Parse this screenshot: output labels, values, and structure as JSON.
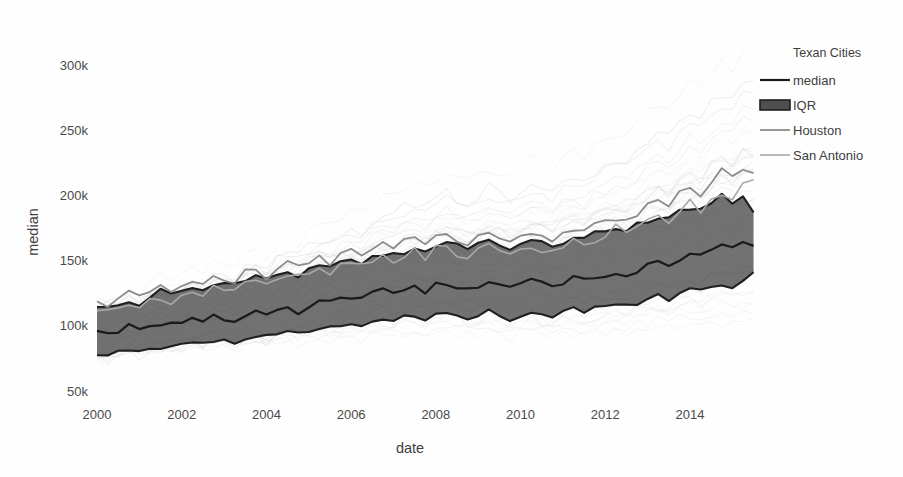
{
  "chart_data": {
    "type": "line",
    "title": "",
    "xlabel": "date",
    "ylabel": "median",
    "xlim": [
      2000.0,
      2015.6
    ],
    "ylim": [
      50000,
      310000
    ],
    "grid": false,
    "y_tick_labels": [
      "50k",
      "100k",
      "150k",
      "200k",
      "250k",
      "300k"
    ],
    "y_tick_values": [
      50000,
      100000,
      150000,
      200000,
      250000,
      300000
    ],
    "x_tick_labels": [
      "2000",
      "2002",
      "2004",
      "2006",
      "2008",
      "2010",
      "2012",
      "2014"
    ],
    "x_tick_values": [
      2000,
      2002,
      2004,
      2006,
      2008,
      2010,
      2012,
      2014
    ],
    "legend": {
      "title": "Texan Cities",
      "position": "right",
      "entries": [
        {
          "label": "median",
          "marker": "line",
          "color": "#1a1a1a",
          "width": 2.2
        },
        {
          "label": "IQR",
          "marker": "band",
          "color": "#555555",
          "width": 9
        },
        {
          "label": "Houston",
          "marker": "line",
          "color": "#8c8c8c",
          "width": 1.8
        },
        {
          "label": "San Antonio",
          "marker": "line",
          "color": "#a8a8a8",
          "width": 1.6
        }
      ]
    },
    "x": [
      2000.0,
      2000.25,
      2000.5,
      2000.75,
      2001.0,
      2001.25,
      2001.5,
      2001.75,
      2002.0,
      2002.25,
      2002.5,
      2002.75,
      2003.0,
      2003.25,
      2003.5,
      2003.75,
      2004.0,
      2004.25,
      2004.5,
      2004.75,
      2005.0,
      2005.25,
      2005.5,
      2005.75,
      2006.0,
      2006.25,
      2006.5,
      2006.75,
      2007.0,
      2007.25,
      2007.5,
      2007.75,
      2008.0,
      2008.25,
      2008.5,
      2008.75,
      2009.0,
      2009.25,
      2009.5,
      2009.75,
      2010.0,
      2010.25,
      2010.5,
      2010.75,
      2011.0,
      2011.25,
      2011.5,
      2011.75,
      2012.0,
      2012.25,
      2012.5,
      2012.75,
      2013.0,
      2013.25,
      2013.5,
      2013.75,
      2014.0,
      2014.25,
      2014.5,
      2014.75,
      2015.0,
      2015.25,
      2015.5
    ],
    "series": [
      {
        "name": "median",
        "color": "#1a1a1a",
        "width": 2.2,
        "values": [
          95000,
          92000,
          97000,
          99000,
          96000,
          100000,
          102000,
          100000,
          103000,
          105000,
          103000,
          106000,
          107000,
          105000,
          109000,
          110000,
          108000,
          112000,
          114000,
          112000,
          116000,
          118000,
          117000,
          120000,
          121000,
          120000,
          124000,
          126000,
          125000,
          128000,
          129000,
          127000,
          130000,
          132000,
          130000,
          128000,
          130000,
          133000,
          131000,
          129000,
          132000,
          134000,
          132000,
          131000,
          134000,
          136000,
          134000,
          137000,
          139000,
          141000,
          140000,
          143000,
          146000,
          148000,
          147000,
          151000,
          154000,
          152000,
          157000,
          160000,
          158000,
          163000,
          163000
        ]
      },
      {
        "name": "IQR_upper",
        "color": "#555555",
        "width": 1,
        "values": [
          115000,
          113000,
          118000,
          120000,
          118000,
          122000,
          125000,
          123000,
          127000,
          129000,
          127000,
          131000,
          133000,
          131000,
          135000,
          137000,
          135000,
          139000,
          142000,
          140000,
          144000,
          147000,
          145000,
          149000,
          151000,
          149000,
          153000,
          156000,
          154000,
          158000,
          160000,
          157000,
          161000,
          163000,
          160000,
          158000,
          161000,
          164000,
          162000,
          159000,
          163000,
          166000,
          163000,
          161000,
          165000,
          168000,
          165000,
          169000,
          172000,
          175000,
          173000,
          177000,
          181000,
          184000,
          182000,
          187000,
          191000,
          188000,
          194000,
          198000,
          195000,
          201000,
          185000
        ]
      },
      {
        "name": "IQR_lower",
        "color": "#555555",
        "width": 1,
        "values": [
          78000,
          76000,
          80000,
          82000,
          80000,
          83000,
          85000,
          83000,
          86000,
          88000,
          86000,
          89000,
          90000,
          88000,
          91000,
          93000,
          91000,
          94000,
          96000,
          94000,
          97000,
          99000,
          97000,
          100000,
          102000,
          100000,
          103000,
          105000,
          103000,
          106000,
          108000,
          106000,
          108000,
          110000,
          108000,
          106000,
          108000,
          110000,
          108000,
          106000,
          109000,
          111000,
          109000,
          107000,
          110000,
          112000,
          110000,
          113000,
          115000,
          117000,
          115000,
          118000,
          121000,
          123000,
          121000,
          125000,
          128000,
          126000,
          130000,
          133000,
          131000,
          136000,
          140000
        ]
      },
      {
        "name": "Houston",
        "color": "#8c8c8c",
        "width": 1.8,
        "values": [
          118000,
          116000,
          121000,
          124000,
          121000,
          126000,
          129000,
          127000,
          131000,
          134000,
          131000,
          136000,
          138000,
          135000,
          140000,
          142000,
          139000,
          144000,
          147000,
          144000,
          149000,
          152000,
          149000,
          154000,
          156000,
          153000,
          158000,
          162000,
          159000,
          164000,
          166000,
          162000,
          167000,
          170000,
          166000,
          163000,
          166000,
          170000,
          167000,
          164000,
          169000,
          173000,
          169000,
          166000,
          171000,
          175000,
          171000,
          176000,
          180000,
          185000,
          181000,
          187000,
          193000,
          198000,
          194000,
          202000,
          208000,
          203000,
          211000,
          218000,
          213000,
          222000,
          219000
        ]
      },
      {
        "name": "San Antonio",
        "color": "#a8a8a8",
        "width": 1.6,
        "values": [
          112000,
          110000,
          114000,
          117000,
          115000,
          119000,
          122000,
          120000,
          124000,
          126000,
          124000,
          128000,
          130000,
          128000,
          132000,
          134000,
          132000,
          136000,
          139000,
          136000,
          141000,
          144000,
          141000,
          146000,
          148000,
          145000,
          150000,
          153000,
          150000,
          155000,
          157000,
          154000,
          158000,
          161000,
          157000,
          154000,
          157000,
          161000,
          158000,
          155000,
          160000,
          163000,
          160000,
          157000,
          162000,
          165000,
          162000,
          166000,
          170000,
          174000,
          171000,
          176000,
          181000,
          186000,
          182000,
          189000,
          195000,
          191000,
          198000,
          204000,
          200000,
          208000,
          213000
        ]
      }
    ],
    "background_series_note": "many faint light-gray city median lines plotted behind, spanning roughly 55k to 260k",
    "background_series_color": "#c9c9c9",
    "background_series_count": 46
  }
}
